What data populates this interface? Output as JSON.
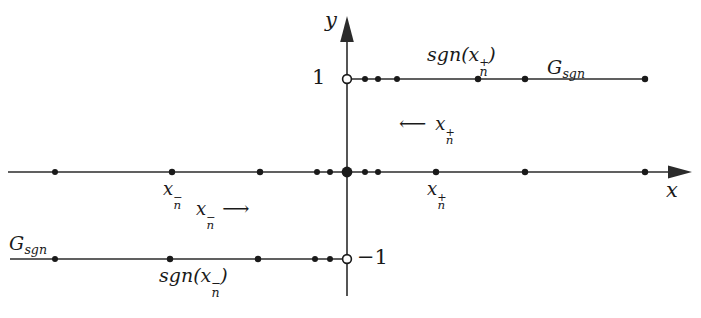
{
  "figure": {
    "width": 701,
    "height": 318,
    "background": "#ffffff",
    "stroke_color": "#2b2b2b",
    "text_color": "#1a1a1a"
  },
  "axes": {
    "x_label": "x",
    "y_label": "y",
    "origin": {
      "x": 347,
      "y": 172
    },
    "x_axis": {
      "x_start": 8,
      "x_end": 690,
      "y": 172,
      "arrow": "right"
    },
    "y_axis": {
      "y_start": 18,
      "y_end": 296,
      "x": 347,
      "arrow": "up"
    }
  },
  "ticks": [
    {
      "name": "one",
      "text": "1",
      "value": 1,
      "x": 330,
      "y": 79,
      "anchor": "end"
    },
    {
      "name": "minus-one",
      "text": "−1",
      "value": -1,
      "x": 358,
      "y": 259,
      "anchor": "start"
    }
  ],
  "branches": [
    {
      "name": "upper-branch",
      "y_value": 1,
      "y_px": 79,
      "x_start_px": 347,
      "x_end_px": 648,
      "open_endpoint": {
        "x": 347,
        "y": 79,
        "filled": false
      },
      "points_px": [
        365,
        378,
        397,
        478,
        525,
        645
      ]
    },
    {
      "name": "lower-branch",
      "y_value": -1,
      "y_px": 259,
      "x_start_px": 10,
      "x_end_px": 347,
      "open_endpoint": {
        "x": 347,
        "y": 259,
        "filled": false
      },
      "points_px": [
        55,
        170,
        258,
        315,
        330
      ]
    },
    {
      "name": "x-axis-left-points",
      "y_value": 0,
      "y_px": 172,
      "points_px": [
        55,
        172,
        260,
        317,
        330
      ]
    },
    {
      "name": "x-axis-right-points",
      "y_value": 0,
      "y_px": 172,
      "points_px": [
        365,
        378,
        436,
        525,
        645
      ]
    }
  ],
  "origin_point": {
    "name": "origin-dot",
    "x": 347,
    "y": 172,
    "radius": 5.4
  },
  "labels": {
    "sgn_positive": {
      "base": "sgn(x",
      "sup": "+",
      "sub": "n",
      "tail": ")",
      "x": 478,
      "y": 57
    },
    "sgn_negative": {
      "base": "sgn(x",
      "sup": "−",
      "sub": "n",
      "tail": ")",
      "x": 210,
      "y": 278
    },
    "graph_upper": {
      "base": "G",
      "sub": "sgn",
      "x": 580,
      "y": 70
    },
    "graph_lower": {
      "base": "G",
      "sub": "sgn",
      "x": 40,
      "y": 246
    },
    "x_n_minus": {
      "base": "x",
      "sup": "−",
      "sub": "n",
      "x": 172,
      "y": 190
    },
    "x_n_plus": {
      "base": "x",
      "sup": "+",
      "sub": "n",
      "x": 436,
      "y": 190
    },
    "flow_positive": {
      "arrow": "⟵",
      "base": "x",
      "sup": "+",
      "sub": "n",
      "x": 400,
      "y": 124
    },
    "flow_negative": {
      "base": "x",
      "sup": "−",
      "sub": "n",
      "arrow": "⟶",
      "x": 196,
      "y": 209
    }
  }
}
